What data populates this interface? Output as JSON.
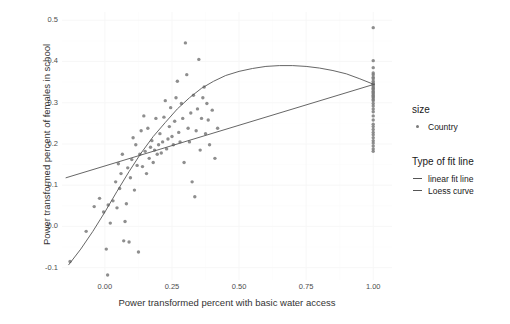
{
  "axes": {
    "x_title": "Power transformed percent with basic water access",
    "y_title": "Power transformed percent of females in school",
    "x_ticks": [
      "0.00",
      "0.25",
      "0.50",
      "0.75",
      "1.00"
    ],
    "y_ticks": [
      "0.5",
      "0.4",
      "0.3",
      "0.2",
      "0.1",
      "0.0",
      "-0.1"
    ]
  },
  "legend": {
    "size": {
      "title": "size",
      "items": [
        {
          "label": "Country",
          "marker": "point-marker",
          "color": "#7a7a7a"
        }
      ]
    },
    "fit": {
      "title": "Type of fit line",
      "items": [
        {
          "label": "linear fit line",
          "marker": "dash-marker",
          "color": "#555555"
        },
        {
          "label": "Loess curve",
          "marker": "dash-marker",
          "color": "#555555"
        }
      ]
    }
  },
  "chart_data": {
    "type": "scatter",
    "title": "",
    "xlabel": "Power transformed percent with basic water access",
    "ylabel": "Power transformed percent of females in school",
    "xlim": [
      -0.16,
      1.07
    ],
    "ylim": [
      -0.13,
      0.52
    ],
    "grid": true,
    "legend_position": "right",
    "point_color": "#7a7a7a",
    "point_radius": 1.7,
    "line_color": "#555555",
    "series": [
      {
        "name": "Country",
        "type": "scatter",
        "points": [
          [
            -0.13,
            -0.085
          ],
          [
            -0.07,
            -0.012
          ],
          [
            -0.04,
            0.048
          ],
          [
            -0.02,
            0.068
          ],
          [
            -0.005,
            0.035
          ],
          [
            0.005,
            -0.055
          ],
          [
            0.01,
            -0.118
          ],
          [
            0.012,
            0.052
          ],
          [
            0.02,
            0.008
          ],
          [
            0.03,
            0.062
          ],
          [
            0.04,
            0.108
          ],
          [
            0.045,
            0.045
          ],
          [
            0.05,
            0.152
          ],
          [
            0.055,
            0.092
          ],
          [
            0.06,
            0.128
          ],
          [
            0.065,
            0.175
          ],
          [
            0.07,
            -0.035
          ],
          [
            0.075,
            0.012
          ],
          [
            0.08,
            0.055
          ],
          [
            0.085,
            0.142
          ],
          [
            0.09,
            -0.038
          ],
          [
            0.095,
            0.118
          ],
          [
            0.1,
            0.162
          ],
          [
            0.105,
            0.215
          ],
          [
            0.11,
            0.088
          ],
          [
            0.115,
            0.198
          ],
          [
            0.12,
            0.148
          ],
          [
            0.125,
            -0.062
          ],
          [
            0.13,
            0.175
          ],
          [
            0.135,
            0.232
          ],
          [
            0.14,
            0.145
          ],
          [
            0.145,
            0.268
          ],
          [
            0.15,
            0.182
          ],
          [
            0.155,
            0.128
          ],
          [
            0.16,
            0.238
          ],
          [
            0.165,
            0.165
          ],
          [
            0.17,
            0.192
          ],
          [
            0.175,
            0.208
          ],
          [
            0.18,
            0.155
          ],
          [
            0.185,
            0.185
          ],
          [
            0.19,
            0.262
          ],
          [
            0.195,
            0.175
          ],
          [
            0.2,
            0.198
          ],
          [
            0.205,
            0.225
          ],
          [
            0.21,
            0.178
          ],
          [
            0.215,
            0.205
          ],
          [
            0.22,
            0.265
          ],
          [
            0.225,
            0.305
          ],
          [
            0.23,
            0.188
          ],
          [
            0.235,
            0.212
          ],
          [
            0.24,
            0.242
          ],
          [
            0.245,
            0.288
          ],
          [
            0.25,
            0.218
          ],
          [
            0.255,
            0.198
          ],
          [
            0.26,
            0.255
          ],
          [
            0.265,
            0.312
          ],
          [
            0.27,
            0.352
          ],
          [
            0.275,
            0.228
          ],
          [
            0.28,
            0.205
          ],
          [
            0.285,
            0.298
          ],
          [
            0.29,
            0.262
          ],
          [
            0.295,
            0.155
          ],
          [
            0.3,
            0.445
          ],
          [
            0.305,
            0.368
          ],
          [
            0.31,
            0.238
          ],
          [
            0.315,
            0.205
          ],
          [
            0.32,
            0.275
          ],
          [
            0.325,
            0.108
          ],
          [
            0.33,
            0.318
          ],
          [
            0.335,
            0.072
          ],
          [
            0.34,
            0.232
          ],
          [
            0.345,
            0.285
          ],
          [
            0.35,
            0.405
          ],
          [
            0.355,
            0.185
          ],
          [
            0.36,
            0.262
          ],
          [
            0.365,
            0.312
          ],
          [
            0.37,
            0.338
          ],
          [
            0.375,
            0.225
          ],
          [
            0.38,
            0.298
          ],
          [
            0.385,
            0.258
          ],
          [
            0.39,
            0.198
          ],
          [
            0.4,
            0.282
          ],
          [
            0.41,
            0.165
          ],
          [
            0.42,
            0.238
          ],
          [
            1.0,
            0.482
          ],
          [
            1.0,
            0.402
          ],
          [
            1.0,
            0.385
          ],
          [
            1.0,
            0.372
          ],
          [
            1.0,
            0.368
          ],
          [
            1.0,
            0.362
          ],
          [
            1.0,
            0.358
          ],
          [
            1.0,
            0.352
          ],
          [
            1.0,
            0.348
          ],
          [
            1.0,
            0.345
          ],
          [
            1.0,
            0.342
          ],
          [
            1.0,
            0.338
          ],
          [
            1.0,
            0.335
          ],
          [
            1.0,
            0.332
          ],
          [
            1.0,
            0.328
          ],
          [
            1.0,
            0.325
          ],
          [
            1.0,
            0.322
          ],
          [
            1.0,
            0.318
          ],
          [
            1.0,
            0.315
          ],
          [
            1.0,
            0.312
          ],
          [
            1.0,
            0.308
          ],
          [
            1.0,
            0.305
          ],
          [
            1.0,
            0.298
          ],
          [
            1.0,
            0.292
          ],
          [
            1.0,
            0.285
          ],
          [
            1.0,
            0.278
          ],
          [
            1.0,
            0.268
          ],
          [
            1.0,
            0.258
          ],
          [
            1.0,
            0.248
          ],
          [
            1.0,
            0.242
          ],
          [
            1.0,
            0.235
          ],
          [
            1.0,
            0.228
          ],
          [
            1.0,
            0.222
          ],
          [
            1.0,
            0.215
          ],
          [
            1.0,
            0.208
          ],
          [
            1.0,
            0.202
          ],
          [
            1.0,
            0.195
          ],
          [
            1.0,
            0.188
          ],
          [
            1.0,
            0.182
          ]
        ]
      },
      {
        "name": "linear fit line",
        "type": "line",
        "points": [
          [
            -0.145,
            0.118
          ],
          [
            1.005,
            0.345
          ]
        ]
      },
      {
        "name": "Loess curve",
        "type": "line",
        "points": [
          [
            -0.135,
            -0.093
          ],
          [
            -0.09,
            -0.055
          ],
          [
            -0.045,
            -0.012
          ],
          [
            0.0,
            0.035
          ],
          [
            0.045,
            0.085
          ],
          [
            0.09,
            0.133
          ],
          [
            0.135,
            0.178
          ],
          [
            0.18,
            0.218
          ],
          [
            0.225,
            0.252
          ],
          [
            0.27,
            0.285
          ],
          [
            0.315,
            0.312
          ],
          [
            0.36,
            0.335
          ],
          [
            0.405,
            0.352
          ],
          [
            0.45,
            0.366
          ],
          [
            0.5,
            0.376
          ],
          [
            0.55,
            0.383
          ],
          [
            0.6,
            0.388
          ],
          [
            0.65,
            0.39
          ],
          [
            0.7,
            0.39
          ],
          [
            0.75,
            0.388
          ],
          [
            0.8,
            0.384
          ],
          [
            0.85,
            0.378
          ],
          [
            0.9,
            0.37
          ],
          [
            0.95,
            0.358
          ],
          [
            1.0,
            0.345
          ]
        ]
      }
    ]
  }
}
